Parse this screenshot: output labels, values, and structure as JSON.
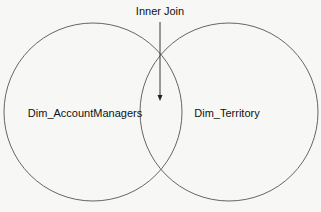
{
  "diagram": {
    "type": "venn",
    "annotation": "Inner Join",
    "sets": [
      {
        "label": "Dim_AccountManagers"
      },
      {
        "label": "Dim_Territory"
      }
    ]
  }
}
